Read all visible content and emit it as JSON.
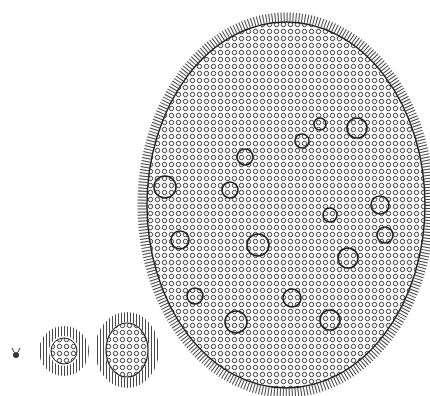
{
  "figure": {
    "background": "#ffffff",
    "ink": "#2a2a2a",
    "stages": [
      {
        "name": "single-cell",
        "cx": 16,
        "cy": 354,
        "r": 3
      },
      {
        "name": "small-colony",
        "cx": 64,
        "cy": 351,
        "r": 14
      },
      {
        "name": "medium-colony",
        "cx": 127,
        "cy": 349,
        "rx": 22,
        "ry": 28
      },
      {
        "name": "mature-colony",
        "cx": 286,
        "cy": 205,
        "rx": 142,
        "ry": 186
      }
    ]
  }
}
